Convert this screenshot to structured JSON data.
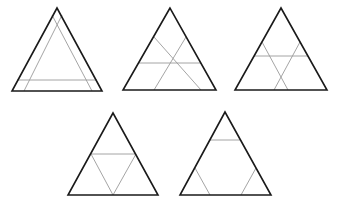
{
  "figure": {
    "width": 341,
    "height": 207,
    "colors": {
      "background": "#ffffff",
      "outline": "#1a1a1a",
      "inner_lines": "#9a9a9a"
    },
    "triangles": [
      {
        "id": "triangle-1",
        "outer": [
          [
            57,
            8
          ],
          [
            12,
            91
          ],
          [
            102,
            91
          ]
        ],
        "inner_lines": [
          [
            [
              52,
              15
            ],
            [
              92,
              91
            ]
          ],
          [
            [
              62,
              15
            ],
            [
              24,
              91
            ]
          ],
          [
            [
              17,
              80
            ],
            [
              97,
              80
            ]
          ]
        ]
      },
      {
        "id": "triangle-2",
        "outer": [
          [
            170,
            8
          ],
          [
            123,
            90
          ],
          [
            216,
            90
          ]
        ],
        "inner_lines": [
          [
            [
              154,
              37
            ],
            [
              201,
              90
            ]
          ],
          [
            [
              186,
              37
            ],
            [
              154,
              90
            ]
          ],
          [
            [
              139,
              63
            ],
            [
              201,
              63
            ]
          ]
        ]
      },
      {
        "id": "triangle-3",
        "outer": [
          [
            281,
            8
          ],
          [
            235,
            90
          ],
          [
            327,
            90
          ]
        ],
        "inner_lines": [
          [
            [
              262,
              42
            ],
            [
              288,
              90
            ]
          ],
          [
            [
              300,
              42
            ],
            [
              274,
              90
            ]
          ],
          [
            [
              254,
              56
            ],
            [
              308,
              56
            ]
          ]
        ]
      },
      {
        "id": "triangle-4",
        "outer": [
          [
            113,
            113
          ],
          [
            68,
            195
          ],
          [
            158,
            195
          ]
        ],
        "inner_lines": [
          [
            [
              91,
              154
            ],
            [
              136,
              154
            ]
          ],
          [
            [
              91,
              154
            ],
            [
              113,
              195
            ]
          ],
          [
            [
              136,
              154
            ],
            [
              113,
              195
            ]
          ]
        ]
      },
      {
        "id": "triangle-5",
        "outer": [
          [
            225,
            112
          ],
          [
            180,
            195
          ],
          [
            271,
            195
          ]
        ],
        "inner_lines": [
          [
            [
              210,
              140
            ],
            [
              241,
              140
            ]
          ],
          [
            [
              195,
              168
            ],
            [
              210,
              195
            ]
          ],
          [
            [
              256,
              168
            ],
            [
              241,
              195
            ]
          ]
        ]
      }
    ]
  }
}
